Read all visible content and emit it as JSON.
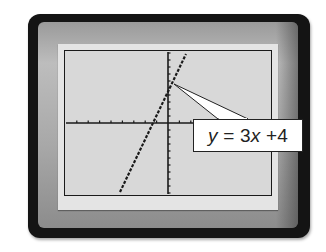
{
  "device": {
    "type": "graphing-calculator-screen",
    "colors": {
      "bezel_outer": "#141414",
      "bezel_inner": "#a8a8a8",
      "screen_frame": "#e4e4e4",
      "lcd_background": "#d8d8d8",
      "plot_ink": "#1a1a1a",
      "label_background": "#ffffff"
    }
  },
  "callout": {
    "y_var": "y",
    "equals": " = 3",
    "x_var": "x",
    "tail": " +4",
    "full_text": "y = 3x + 4"
  },
  "chart_data": {
    "type": "line",
    "title": "",
    "xlabel": "",
    "ylabel": "",
    "grid": false,
    "axes": "tick-marked x and y axes, no numeric tick labels",
    "xlim": [
      -10,
      6
    ],
    "ylim": [
      -10,
      10
    ],
    "x_tick_step": 1,
    "y_tick_step": 1,
    "series": [
      {
        "name": "y = 3x + 4",
        "equation": "y = 3x + 4",
        "slope": 3,
        "intercept": 4,
        "style": "dotted",
        "x": [
          -4.67,
          -3,
          -2,
          -1.33,
          -1,
          0,
          1,
          2
        ],
        "y": [
          -10,
          -5,
          -2,
          0,
          1,
          4,
          7,
          10
        ]
      }
    ],
    "annotations": [
      {
        "text": "y = 3x + 4",
        "points_to": [
          0.5,
          5.5
        ],
        "position": "right of graph"
      }
    ]
  }
}
